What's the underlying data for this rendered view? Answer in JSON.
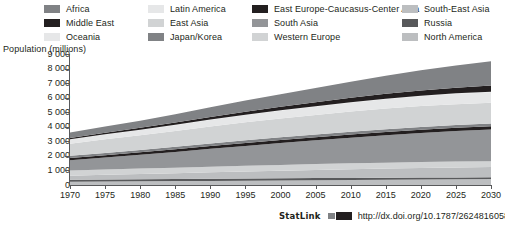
{
  "axis_title": "Population (millions)",
  "statlink": {
    "word": "StatLink",
    "glyph": "statlink-barcode-icon",
    "url": "http://dx.doi.org/10.1787/262481605856"
  },
  "legend": {
    "columns": [
      {
        "x": 44,
        "entries": [
          {
            "label": "Africa",
            "color": "#808285"
          },
          {
            "label": "Middle East",
            "color": "#231f20"
          },
          {
            "label": "Oceania",
            "color": "#e6e7e8"
          }
        ]
      },
      {
        "x": 148,
        "entries": [
          {
            "label": "Latin America",
            "color": "#e6e7e8"
          },
          {
            "label": "East Asia",
            "color": "#d1d3d4"
          },
          {
            "label": "Japan/Korea",
            "color": "#808285"
          }
        ]
      },
      {
        "x": 252,
        "entries": [
          {
            "label": "East Europe-Caucasus-Center Asia",
            "color": "#231f20"
          },
          {
            "label": "South Asia",
            "color": "#939598"
          },
          {
            "label": "Western Europe",
            "color": "#d1d3d4"
          }
        ]
      },
      {
        "x": 402,
        "entries": [
          {
            "label": "South-East Asia",
            "color": "#bcbec0"
          },
          {
            "label": "Russia",
            "color": "#58595b"
          },
          {
            "label": "North America",
            "color": "#bcbec0"
          }
        ]
      }
    ]
  },
  "chart_data": {
    "type": "area",
    "stacked": true,
    "title": "",
    "xlabel": "",
    "ylabel": "Population (millions)",
    "xlim": [
      1970,
      2030
    ],
    "ylim": [
      0,
      9000
    ],
    "grid": false,
    "legend_position": "top",
    "y_ticks": [
      0,
      1000,
      2000,
      3000,
      4000,
      5000,
      6000,
      7000,
      8000,
      9000
    ],
    "y_tick_labels": [
      "0",
      "1 000",
      "2 000",
      "3 000",
      "4 000",
      "5 000",
      "6 000",
      "7 000",
      "8 000",
      "9 000"
    ],
    "x_ticks": [
      1970,
      1975,
      1980,
      1985,
      1990,
      1995,
      2000,
      2005,
      2010,
      2015,
      2020,
      2025,
      2030
    ],
    "x_tick_labels": [
      "1970",
      "1975",
      "1980",
      "1985",
      "1990",
      "1995",
      "2000",
      "2005",
      "2010",
      "2015",
      "2020",
      "2025",
      "2030"
    ],
    "x": [
      1970,
      1975,
      1980,
      1985,
      1990,
      1995,
      2000,
      2005,
      2010,
      2015,
      2020,
      2025,
      2030
    ],
    "series": [
      {
        "name": "North America",
        "color": "#bcbec0",
        "values": [
          226,
          243,
          256,
          269,
          283,
          299,
          316,
          332,
          348,
          364,
          379,
          393,
          405
        ]
      },
      {
        "name": "Russia",
        "color": "#58595b",
        "values": [
          130,
          134,
          139,
          143,
          148,
          148,
          146,
          143,
          140,
          137,
          134,
          130,
          126
        ]
      },
      {
        "name": "South-East Asia",
        "color": "#bcbec0",
        "values": [
          286,
          322,
          360,
          400,
          441,
          481,
          521,
          558,
          594,
          627,
          656,
          680,
          700
        ]
      },
      {
        "name": "Western Europe",
        "color": "#d1d3d4",
        "values": [
          352,
          364,
          372,
          379,
          386,
          392,
          397,
          402,
          406,
          409,
          410,
          409,
          407
        ]
      },
      {
        "name": "South Asia",
        "color": "#939598",
        "values": [
          713,
          822,
          947,
          1084,
          1225,
          1366,
          1501,
          1635,
          1765,
          1888,
          2000,
          2098,
          2180
        ]
      },
      {
        "name": "East Europe-Caucasus-Center Asia",
        "color": "#231f20",
        "values": [
          155,
          165,
          176,
          187,
          197,
          201,
          203,
          205,
          208,
          211,
          213,
          215,
          216
        ]
      },
      {
        "name": "Japan/Korea",
        "color": "#808285",
        "values": [
          139,
          150,
          160,
          169,
          178,
          185,
          191,
          195,
          198,
          199,
          198,
          196,
          193
        ]
      },
      {
        "name": "East Asia",
        "color": "#d1d3d4",
        "values": [
          834,
          938,
          1000,
          1075,
          1165,
          1242,
          1300,
          1347,
          1390,
          1419,
          1434,
          1435,
          1424
        ]
      },
      {
        "name": "Latin America",
        "color": "#e6e7e8",
        "values": [
          287,
          325,
          365,
          406,
          446,
          487,
          527,
          566,
          604,
          639,
          670,
          697,
          719
        ]
      },
      {
        "name": "Oceania",
        "color": "#e6e7e8",
        "values": [
          19,
          21,
          23,
          25,
          27,
          29,
          31,
          33,
          36,
          38,
          41,
          43,
          45
        ]
      },
      {
        "name": "Middle East",
        "color": "#231f20",
        "values": [
          95,
          112,
          133,
          157,
          184,
          211,
          240,
          271,
          303,
          334,
          364,
          392,
          417
        ]
      },
      {
        "name": "Africa",
        "color": "#808285",
        "values": [
          365,
          422,
          491,
          572,
          662,
          760,
          864,
          978,
          1104,
          1239,
          1380,
          1524,
          1667
        ]
      }
    ],
    "totals": [
      3601,
      4016,
      4422,
      4866,
      5342,
      5801,
      6237,
      6665,
      7096,
      7504,
      7879,
      8212,
      8499
    ]
  }
}
